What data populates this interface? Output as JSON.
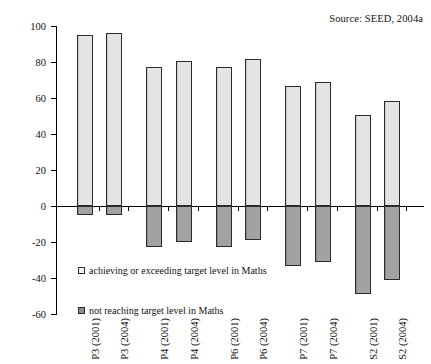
{
  "annotation": {
    "source_note": "Source: SEED, 2004a"
  },
  "legend": {
    "items": [
      {
        "label": "achieving or exceeding target level in Maths",
        "swatch": "light",
        "color": "#f2f2f2"
      },
      {
        "label": "not reaching target level in Maths",
        "swatch": "dark",
        "color": "#8f8f8f"
      }
    ]
  },
  "axis": {
    "y_ticks": [
      "100",
      "80",
      "60",
      "40",
      "20",
      "0",
      "-20",
      "-40",
      "-60"
    ],
    "y_values": [
      100,
      80,
      60,
      40,
      20,
      0,
      -20,
      -40,
      -60
    ]
  },
  "chart_data": {
    "type": "bar",
    "title": "",
    "xlabel": "",
    "ylabel": "",
    "ylim": [
      -60,
      100
    ],
    "grid": false,
    "legend_position": "inside-lower-left",
    "categories": [
      "P3 (2001)",
      "P3 (2004)",
      "P4 (2001)",
      "P4 (2004)",
      "P6 (2001)",
      "P6 (2004)",
      "P7 (2001)",
      "P7 (2004)",
      "S2 (2001)",
      "S2 (2004)"
    ],
    "group_breaks_after": [
      1,
      3,
      5,
      7
    ],
    "series": [
      {
        "name": "achieving or exceeding target level in Maths",
        "color": "#dcdcdc",
        "values": [
          95,
          96,
          77,
          80.5,
          77.5,
          81.5,
          66.5,
          69,
          50.5,
          58.5
        ]
      },
      {
        "name": "not reaching target level in Maths",
        "color": "#9a9a9a",
        "values": [
          -5,
          -5,
          -23,
          -20,
          -23,
          -19,
          -33.5,
          -31,
          -49,
          -41
        ]
      }
    ]
  }
}
